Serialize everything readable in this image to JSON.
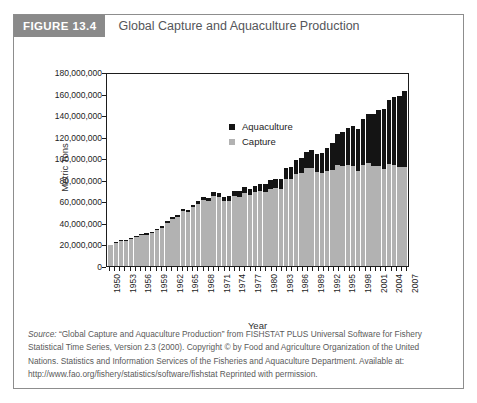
{
  "figure": {
    "badge": "FIGURE 13.4",
    "title": "Global Capture and Aquaculture Production",
    "badge_color": "#8a8a8a",
    "frame_border_color": "#8d8d8d"
  },
  "legend": {
    "position": "top-left-inside-plot",
    "items": [
      {
        "label": "Aquaculture",
        "color": "#141414"
      },
      {
        "label": "Capture",
        "color": "#b2b2b2"
      }
    ]
  },
  "source": {
    "label": "Source:",
    "text": " “Global Capture and Aquaculture Production” from FISHSTAT PLUS Universal Software for Fishery Statistical Time Series, Version 2.3 (2000). Copyright © by Food and Agriculture Organization of the United Nations. Statistics and Information Services of the Fisheries and Aquaculture Department. Available at: http://www.fao.org/fishery/statistics/software/fishstat Reprinted with permission."
  },
  "chart_data": {
    "type": "bar",
    "stacked": true,
    "title": "Global Capture and Aquaculture Production",
    "xlabel": "Year",
    "ylabel": "Metric Tons",
    "ylim": [
      0,
      180000000
    ],
    "ytick_step": 20000000,
    "ytick_labels": [
      "0",
      "20,000,000",
      "40,000,000",
      "60,000,000",
      "80,000,000",
      "100,000,000",
      "120,000,000",
      "140,000,000",
      "160,000,000",
      "180,000,000"
    ],
    "grid": false,
    "xtick_label_every": 3,
    "xtick_labels": [
      "1950",
      "1953",
      "1956",
      "1959",
      "1962",
      "1965",
      "1968",
      "1971",
      "1974",
      "1977",
      "1980",
      "1983",
      "1986",
      "1989",
      "1992",
      "1995",
      "1998",
      "2001",
      "2004",
      "2007"
    ],
    "categories": [
      1950,
      1951,
      1952,
      1953,
      1954,
      1955,
      1956,
      1957,
      1958,
      1959,
      1960,
      1961,
      1962,
      1963,
      1964,
      1965,
      1966,
      1967,
      1968,
      1969,
      1970,
      1971,
      1972,
      1973,
      1974,
      1975,
      1976,
      1977,
      1978,
      1979,
      1980,
      1981,
      1982,
      1983,
      1984,
      1985,
      1986,
      1987,
      1988,
      1989,
      1990,
      1991,
      1992,
      1993,
      1994,
      1995,
      1996,
      1997,
      1998,
      1999,
      2000,
      2001,
      2002,
      2003,
      2004,
      2005,
      2006,
      2007
    ],
    "series": [
      {
        "name": "Capture",
        "color": "#b2b2b2",
        "values": [
          19200000,
          21400000,
          23000000,
          23400000,
          25300000,
          26800000,
          28500000,
          29100000,
          30200000,
          33100000,
          35300000,
          40100000,
          43400000,
          45100000,
          50900000,
          50000000,
          54500000,
          57400000,
          61500000,
          60200000,
          64800000,
          64400000,
          60300000,
          60500000,
          65200000,
          64200000,
          67700000,
          66100000,
          68600000,
          69500000,
          69000000,
          71800000,
          72200000,
          71800000,
          80800000,
          80800000,
          85800000,
          86600000,
          91100000,
          91000000,
          86800000,
          86200000,
          88100000,
          89200000,
          94000000,
          92800000,
          93800000,
          93200000,
          87700000,
          93500000,
          95500000,
          92800000,
          93000000,
          90200000,
          94900000,
          93900000,
          91500000,
          91900000
        ]
      },
      {
        "name": "Aquaculture",
        "color": "#141414",
        "values": [
          600000,
          650000,
          700000,
          750000,
          800000,
          900000,
          1000000,
          1100000,
          1200000,
          1350000,
          1500000,
          1650000,
          1800000,
          1950000,
          2100000,
          2300000,
          2500000,
          2700000,
          2900000,
          3100000,
          3500000,
          3700000,
          4000000,
          4200000,
          4600000,
          5000000,
          5400000,
          5700000,
          6100000,
          6700000,
          7300000,
          7700000,
          8400000,
          9100000,
          10000000,
          11400000,
          12500000,
          13800000,
          15000000,
          16300000,
          16800000,
          18300000,
          21200000,
          24500000,
          28500000,
          31200000,
          34700000,
          36700000,
          39400000,
          42800000,
          45700000,
          48400000,
          51600000,
          55200000,
          59000000,
          62900000,
          66700000,
          70300000
        ]
      }
    ]
  }
}
